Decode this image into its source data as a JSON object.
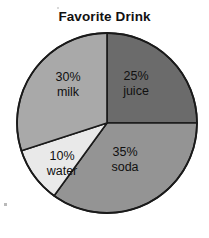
{
  "chart_data": {
    "type": "pie",
    "title": "Favorite Drink",
    "xlabel": "",
    "ylabel": "",
    "categories": [
      "juice",
      "soda",
      "water",
      "milk"
    ],
    "values": [
      25,
      35,
      10,
      30
    ],
    "value_unit": "%",
    "legend": "none",
    "grid": false,
    "start_angle_deg": 0,
    "direction": "clockwise",
    "slices": [
      {
        "label": "juice",
        "value": 25,
        "percent_text": "25%",
        "name_text": "juice",
        "color": "#6b6b6b",
        "start_deg": 0,
        "end_deg": 90
      },
      {
        "label": "soda",
        "value": 35,
        "percent_text": "35%",
        "name_text": "soda",
        "color": "#949494",
        "start_deg": 90,
        "end_deg": 216
      },
      {
        "label": "water",
        "value": 10,
        "percent_text": "10%",
        "name_text": "water",
        "color": "#e9e9e9",
        "start_deg": 216,
        "end_deg": 252
      },
      {
        "label": "milk",
        "value": 30,
        "percent_text": "30%",
        "name_text": "milk",
        "color": "#a9a9a9",
        "start_deg": 252,
        "end_deg": 360
      }
    ],
    "geometry": {
      "center_x": 107,
      "center_y": 123,
      "radius": 90
    },
    "stroke_color": "#1a1a1a",
    "background_color": "#ffffff"
  }
}
